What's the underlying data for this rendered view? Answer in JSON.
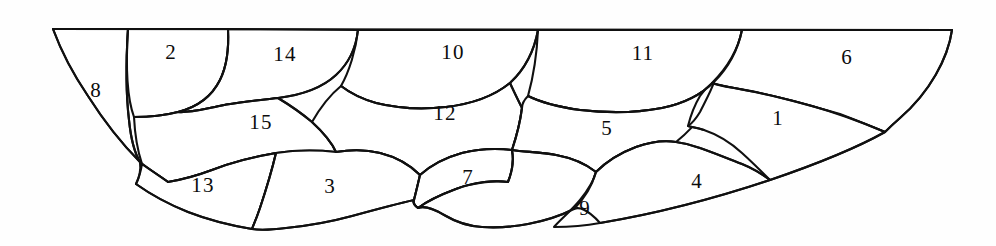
{
  "figure": {
    "kind": "subdivided-region-diagram",
    "width": 996,
    "height": 246,
    "background_color": "#fefefe",
    "ink_color": "#101010",
    "fill_color": "#ffffff",
    "stroke_width": 2.1,
    "label_count": 15
  },
  "outline": {
    "name": "region-outline",
    "top_left": [
      53,
      29
    ],
    "top_right": [
      952,
      30
    ],
    "path": "M 53,29 L 952,30 C 948,58 930,92 900,118 C 892,125 888,129 885,132 C 860,146 820,163 770,180 C 716,198 660,213 600,223 C 540,233 470,237 420,233 C 370,229 320,220 280,211 C 240,202 200,188 170,170 C 140,152 110,126 90,98 C 72,73 60,48 53,29 Z"
  },
  "regions": [
    {
      "id": 8,
      "label": "8",
      "label_x": 96,
      "label_y": 90,
      "path": "M 53,29 L 128,29 C 126,60 126,95 129,120 C 131,140 134,152 140,162 C 120,142 102,118 88,96 C 72,72 60,48 53,29 Z"
    },
    {
      "id": 2,
      "label": "2",
      "label_x": 171,
      "label_y": 52,
      "path": "M 128,29 L 228,29 C 229,48 227,66 220,80 C 212,96 198,107 178,112 C 163,116 148,117 134,117 C 126,95 126,60 128,29 Z"
    },
    {
      "id": 14,
      "label": "14",
      "label_x": 285,
      "label_y": 54,
      "path": "M 228,29 L 358,30 C 356,48 348,64 336,75 C 322,88 302,95 278,98 C 252,101 228,103 215,107 C 200,110 188,113 178,112 C 198,107 212,96 220,80 C 227,66 229,48 228,29 Z"
    },
    {
      "id": 10,
      "label": "10",
      "label_x": 453,
      "label_y": 52,
      "path": "M 358,30 L 538,30 C 534,52 524,70 510,83 C 494,96 472,104 446,107 C 420,110 396,108 376,103 C 362,99 350,93 341,86 C 349,72 356,50 358,30 Z"
    },
    {
      "id": 11,
      "label": "11",
      "label_x": 643,
      "label_y": 53,
      "path": "M 538,30 L 742,30 C 738,50 728,68 714,82 C 700,96 682,104 662,108 C 636,113 606,113 580,110 C 558,107 540,102 528,96 C 533,78 537,52 538,30 Z"
    },
    {
      "id": 6,
      "label": "6",
      "label_x": 847,
      "label_y": 57,
      "path": "M 742,30 L 952,30 C 948,58 930,92 900,118 C 892,125 888,129 885,132 C 866,124 840,114 812,106 C 784,98 756,92 734,88 C 722,86 714,84 712,83 C 726,69 738,50 742,30 Z"
    },
    {
      "id": 15,
      "label": "15",
      "label_x": 261,
      "label_y": 122,
      "path": "M 134,117 C 148,117 163,116 178,112 C 188,113 200,110 215,107 C 228,103 252,101 278,98 C 288,104 300,112 312,122 C 324,133 332,143 336,152 C 318,150 296,150 276,153 C 252,157 230,163 212,170 C 196,176 180,180 168,182 C 160,176 150,170 142,164 C 138,152 135,138 134,117 Z"
    },
    {
      "id": 12,
      "label": "12",
      "label_x": 445,
      "label_y": 113,
      "path": "M 341,86 C 350,93 362,99 376,103 C 396,108 420,110 446,107 C 472,104 494,96 510,83 C 514,92 518,100 522,108 C 520,124 516,138 512,150 C 496,148 478,149 462,153 C 444,158 430,166 420,175 C 410,165 396,157 380,153 C 364,149 348,150 336,152 C 332,143 324,133 312,122 C 320,108 330,95 341,86 Z"
    },
    {
      "id": 5,
      "label": "5",
      "label_x": 607,
      "label_y": 128,
      "path": "M 528,96 C 540,102 558,107 580,110 C 606,113 636,113 662,108 C 682,104 700,96 714,82 C 716,89 712,100 704,112 C 696,124 686,134 676,142 C 664,140 650,142 636,147 C 620,153 606,162 596,172 C 586,164 572,158 556,155 C 540,152 524,152 512,150 C 516,138 520,124 522,108 C 522,103 525,99 528,96 Z"
    },
    {
      "id": 1,
      "label": "1",
      "label_x": 778,
      "label_y": 118,
      "path": "M 712,83 C 714,84 722,86 734,88 C 756,92 784,98 812,106 C 840,114 866,124 885,132 C 860,146 820,163 770,180 C 762,172 752,162 742,153 C 730,142 716,134 704,130 C 698,128 692,127 688,126 C 690,118 694,106 700,96 C 704,90 708,86 712,83 Z"
    },
    {
      "id": 13,
      "label": "13",
      "label_x": 203,
      "label_y": 185,
      "path": "M 142,164 C 150,170 160,176 168,182 C 180,180 196,176 212,170 C 230,163 252,157 276,153 C 272,170 266,190 260,208 C 256,220 253,226 252,229 C 228,225 206,219 188,212 C 168,204 150,194 136,184 C 140,176 141,170 142,164 Z"
    },
    {
      "id": 3,
      "label": "3",
      "label_x": 330,
      "label_y": 186,
      "path": "M 276,153 C 296,150 318,150 336,152 C 348,150 364,149 380,153 C 396,157 410,165 420,175 C 418,184 416,192 414,200 C 396,204 374,210 352,216 C 330,222 306,226 286,228 C 270,230 258,230 252,229 C 253,226 256,220 260,208 C 266,190 272,170 276,153 Z"
    },
    {
      "id": 7,
      "label": "7",
      "label_x": 468,
      "label_y": 177,
      "path": "M 420,175 C 430,166 444,158 462,153 C 478,149 496,148 512,150 C 514,160 512,172 508,182 C 492,180 472,183 456,189 C 440,195 426,202 418,208 C 414,205 413,202 414,200 C 416,192 418,184 420,175 Z"
    },
    {
      "id": 9,
      "label": "9",
      "label_x": 585,
      "label_y": 208,
      "path": "M 512,150 C 524,152 540,152 556,155 C 572,158 586,164 596,172 C 592,186 584,199 574,209 C 560,216 544,221 528,224 C 512,227 496,228 482,227 C 468,226 456,222 446,216 C 436,210 426,205 418,208 C 426,202 440,195 456,189 C 472,183 492,180 508,182 C 512,172 514,160 512,150 Z"
    },
    {
      "id": 4,
      "label": "4",
      "label_x": 697,
      "label_y": 181,
      "path": "M 596,172 C 606,162 620,153 636,147 C 650,142 664,140 676,142 C 684,143 692,145 700,148 C 712,152 726,158 742,164 C 752,168 762,174 770,180 C 716,198 660,213 600,223 C 584,226 568,227 554,227 C 560,220 572,210 580,200 C 588,190 594,180 596,172 Z"
    }
  ],
  "labels": [
    {
      "text": "8",
      "x": 96,
      "y": 90
    },
    {
      "text": "2",
      "x": 171,
      "y": 52
    },
    {
      "text": "14",
      "x": 285,
      "y": 54
    },
    {
      "text": "10",
      "x": 453,
      "y": 52
    },
    {
      "text": "11",
      "x": 643,
      "y": 53
    },
    {
      "text": "6",
      "x": 847,
      "y": 57
    },
    {
      "text": "15",
      "x": 261,
      "y": 122
    },
    {
      "text": "12",
      "x": 445,
      "y": 113
    },
    {
      "text": "5",
      "x": 607,
      "y": 128
    },
    {
      "text": "1",
      "x": 778,
      "y": 118
    },
    {
      "text": "13",
      "x": 203,
      "y": 185
    },
    {
      "text": "3",
      "x": 330,
      "y": 186
    },
    {
      "text": "7",
      "x": 468,
      "y": 177
    },
    {
      "text": "9",
      "x": 585,
      "y": 208
    },
    {
      "text": "4",
      "x": 697,
      "y": 181
    }
  ],
  "edges": [
    {
      "name": "top-border",
      "path": "M 53,29 L 952,30"
    },
    {
      "name": "outer-left",
      "path": "M 53,29 C 60,48 72,73 88,96 C 102,118 120,142 140,162 C 150,170 160,176 168,182"
    },
    {
      "name": "outer-bottom-left",
      "path": "M 136,184 C 150,194 168,204 188,212 C 206,219 228,225 252,229"
    },
    {
      "name": "outer-bottom-mid",
      "path": "M 252,229 C 258,230 270,230 286,228 C 306,226 330,222 352,216 C 374,210 396,204 414,200 C 413,202 414,205 418,208 C 426,205 436,210 446,216 C 456,222 468,226 482,227 C 496,228 512,227 528,224 C 544,221 560,216 574,209"
    },
    {
      "name": "outer-bottom-right",
      "path": "M 574,209 C 584,204 600,223 600,223 C 660,213 716,198 770,180 C 820,163 860,146 885,132"
    },
    {
      "name": "outer-right",
      "path": "M 885,132 C 888,129 892,125 900,118 C 930,92 948,58 952,30"
    },
    {
      "name": "edge-8-2",
      "path": "M 128,29 C 126,60 126,95 129,120 C 131,140 134,152 140,162"
    },
    {
      "name": "edge-2-14",
      "path": "M 228,29 C 229,48 227,66 220,80 C 212,96 198,107 178,112"
    },
    {
      "name": "edge-2-15",
      "path": "M 134,117 C 148,117 163,116 178,112"
    },
    {
      "name": "edge-14-15",
      "path": "M 178,112 C 188,113 200,110 215,107 C 228,103 252,101 278,98"
    },
    {
      "name": "edge-14-10",
      "path": "M 358,30 C 356,48 348,64 336,75 C 322,88 302,95 278,98"
    },
    {
      "name": "edge-15-12",
      "path": "M 278,98 C 288,104 300,112 312,122 C 324,133 332,143 336,152"
    },
    {
      "name": "edge-10-12",
      "path": "M 341,86 C 350,93 362,99 376,103 C 396,108 420,110 446,107 C 472,104 494,96 510,83"
    },
    {
      "name": "edge-10-11",
      "path": "M 538,30 C 534,52 524,70 510,83"
    },
    {
      "name": "edge-11-5",
      "path": "M 528,96 C 540,102 558,107 580,110 C 606,113 636,113 662,108 C 682,104 700,96 714,82"
    },
    {
      "name": "edge-11-6",
      "path": "M 742,30 C 738,50 728,68 714,82"
    },
    {
      "name": "edge-6-1",
      "path": "M 712,83 C 722,86 734,88 756,92 C 784,98 812,106 840,114 C 866,124 885,132 885,132"
    },
    {
      "name": "edge-12-5",
      "path": "M 510,83 C 514,92 518,100 522,108 C 520,124 516,138 512,150"
    },
    {
      "name": "edge-5-1",
      "path": "M 714,82 C 712,89 706,100 700,112 C 694,122 688,126 688,126 C 692,127 698,128 704,130"
    },
    {
      "name": "edge-15-13",
      "path": "M 140,162 C 141,170 140,176 136,184"
    },
    {
      "name": "edge-15-3",
      "path": "M 168,182 C 180,180 196,176 212,170 C 230,163 252,157 276,153"
    },
    {
      "name": "edge-13-3",
      "path": "M 276,153 C 272,170 266,190 260,208 C 256,220 253,226 252,229"
    },
    {
      "name": "edge-12-3",
      "path": "M 336,152 C 348,150 364,149 380,153 C 396,157 410,165 420,175"
    },
    {
      "name": "edge-3-7",
      "path": "M 420,175 C 418,184 416,192 414,200 C 413,202 414,205 418,208"
    },
    {
      "name": "edge-12-7",
      "path": "M 420,175 C 430,166 444,158 462,153 C 478,149 496,148 512,150"
    },
    {
      "name": "edge-7-9",
      "path": "M 512,150 C 514,160 512,172 508,182 C 494,180 472,183 456,189 C 440,195 426,202 418,208"
    },
    {
      "name": "edge-5-9",
      "path": "M 512,150 C 524,152 540,152 556,155 C 572,158 586,164 596,172"
    },
    {
      "name": "edge-9-4",
      "path": "M 596,172 C 592,186 584,199 574,209"
    },
    {
      "name": "edge-5-4",
      "path": "M 596,172 C 606,162 620,153 636,147 C 650,142 664,140 676,142"
    },
    {
      "name": "edge-4-1",
      "path": "M 676,142 C 684,143 692,145 700,148 C 712,152 726,158 742,164 C 752,168 762,174 770,180"
    }
  ]
}
